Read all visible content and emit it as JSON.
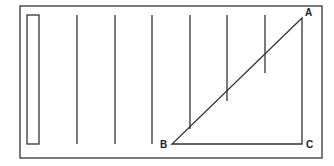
{
  "diagram": {
    "stroke_color": "#333333",
    "frame": {
      "x": 20,
      "y": 6,
      "w": 302,
      "h": 152
    },
    "inner_rect": {
      "x": 27,
      "y": 15,
      "w": 12,
      "h": 129
    },
    "vertical_lines": [
      {
        "x": 77,
        "y1": 15,
        "y2": 144
      },
      {
        "x": 115,
        "y1": 15,
        "y2": 144
      },
      {
        "x": 152,
        "y1": 15,
        "y2": 144
      },
      {
        "x": 190,
        "y1": 15,
        "y2": 129
      },
      {
        "x": 227,
        "y1": 15,
        "y2": 101
      },
      {
        "x": 265,
        "y1": 15,
        "y2": 73
      }
    ],
    "triangle": {
      "A": {
        "x": 302,
        "y": 18
      },
      "B": {
        "x": 172,
        "y": 144
      },
      "C": {
        "x": 302,
        "y": 144
      }
    },
    "labels": {
      "A": "A",
      "B": "B",
      "C": "C"
    }
  }
}
